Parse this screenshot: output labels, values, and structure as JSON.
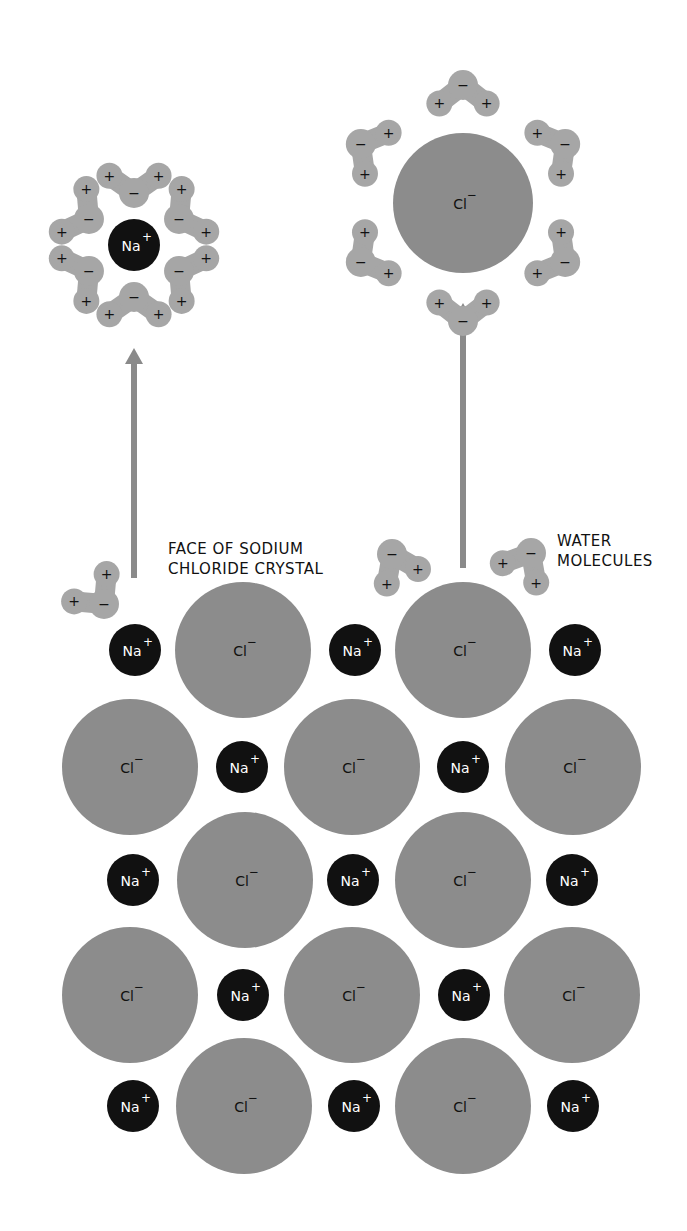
{
  "labels": {
    "crystal_face_line1": "FACE OF SODIUM",
    "crystal_face_line2": "CHLORIDE CRYSTAL",
    "water_line1": "WATER",
    "water_line2": "MOLECULES"
  },
  "ions": {
    "sodium": {
      "symbol": "Na",
      "charge": "+"
    },
    "chloride": {
      "symbol": "Cl",
      "charge": "−"
    }
  },
  "water_charges": {
    "oxygen": "−",
    "hydrogen": "+"
  },
  "colors": {
    "background": "#ffffff",
    "chloride": "#8c8c8c",
    "sodium": "#111111",
    "water": "#a6a6a6",
    "arrow": "#8a8a8a",
    "text_dark": "#111111",
    "text_light": "#ffffff"
  },
  "lattice": {
    "rows": [
      {
        "y": 650,
        "ions": [
          {
            "type": "Na",
            "x": 135
          },
          {
            "type": "Cl",
            "x": 243
          },
          {
            "type": "Na",
            "x": 355
          },
          {
            "type": "Cl",
            "x": 463
          },
          {
            "type": "Na",
            "x": 575
          }
        ]
      },
      {
        "y": 767,
        "ions": [
          {
            "type": "Cl",
            "x": 130
          },
          {
            "type": "Na",
            "x": 242
          },
          {
            "type": "Cl",
            "x": 352
          },
          {
            "type": "Na",
            "x": 463
          },
          {
            "type": "Cl",
            "x": 573
          }
        ]
      },
      {
        "y": 880,
        "ions": [
          {
            "type": "Na",
            "x": 133
          },
          {
            "type": "Cl",
            "x": 245
          },
          {
            "type": "Na",
            "x": 353
          },
          {
            "type": "Cl",
            "x": 463
          },
          {
            "type": "Na",
            "x": 572
          }
        ]
      },
      {
        "y": 995,
        "ions": [
          {
            "type": "Cl",
            "x": 130
          },
          {
            "type": "Na",
            "x": 243
          },
          {
            "type": "Cl",
            "x": 352
          },
          {
            "type": "Na",
            "x": 464
          },
          {
            "type": "Cl",
            "x": 572
          }
        ]
      },
      {
        "y": 1106,
        "ions": [
          {
            "type": "Na",
            "x": 133
          },
          {
            "type": "Cl",
            "x": 244
          },
          {
            "type": "Na",
            "x": 354
          },
          {
            "type": "Cl",
            "x": 463
          },
          {
            "type": "Na",
            "x": 573
          }
        ]
      }
    ]
  },
  "hydrated_sodium": {
    "x": 134,
    "y": 245,
    "water_count": 6
  },
  "hydrated_chloride": {
    "x": 463,
    "y": 203,
    "water_count": 6
  },
  "arrows": [
    {
      "from": [
        134,
        578
      ],
      "to": [
        134,
        350
      ]
    },
    {
      "from": [
        463,
        568
      ],
      "to": [
        463,
        305
      ]
    }
  ]
}
